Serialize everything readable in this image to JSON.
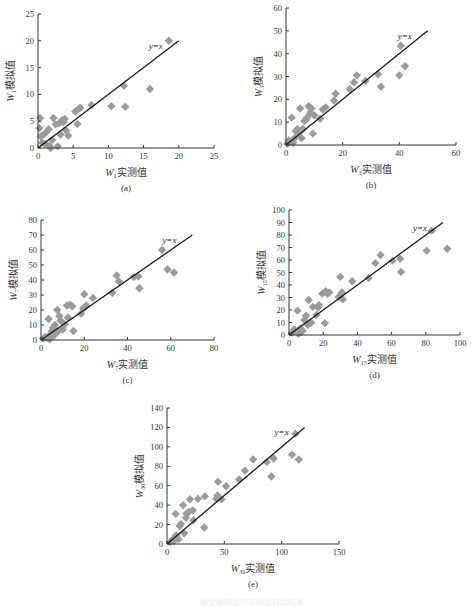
{
  "figure_caption": "模型模拟值与实测值对比结果",
  "chart_data": [
    {
      "id": "a",
      "type": "scatter",
      "panel_label": "(a)",
      "xlabel": "W1实测值",
      "xlabel_var": "W",
      "xlabel_sub": "1",
      "xlabel_text": "实测值",
      "ylabel": "W1模拟值",
      "ylabel_var": "W",
      "ylabel_sub": "1",
      "ylabel_text": "模拟值",
      "xlim": [
        0,
        25
      ],
      "ylim": [
        0,
        25
      ],
      "xticks": [
        0,
        5,
        10,
        15,
        20,
        25
      ],
      "yticks": [
        0,
        5,
        10,
        15,
        20,
        25
      ],
      "reference_line": {
        "label": "y=x",
        "from": [
          0,
          0
        ],
        "to": [
          20,
          20
        ]
      },
      "legend": "none",
      "grid": false,
      "points": [
        [
          0.2,
          3.7
        ],
        [
          0.3,
          5.6
        ],
        [
          0.4,
          2.2
        ],
        [
          0.6,
          1.0
        ],
        [
          0.8,
          2.5
        ],
        [
          1.0,
          0.8
        ],
        [
          1.2,
          3.0
        ],
        [
          1.5,
          3.5
        ],
        [
          1.6,
          0.4
        ],
        [
          1.8,
          0.0
        ],
        [
          2.0,
          1.5
        ],
        [
          2.2,
          5.6
        ],
        [
          2.5,
          4.4
        ],
        [
          2.8,
          0.3
        ],
        [
          3.0,
          4.6
        ],
        [
          3.2,
          2.5
        ],
        [
          3.4,
          5.2
        ],
        [
          3.6,
          4.8
        ],
        [
          3.8,
          5.4
        ],
        [
          4.0,
          3.2
        ],
        [
          4.3,
          2.3
        ],
        [
          5.3,
          6.8
        ],
        [
          5.6,
          4.5
        ],
        [
          5.8,
          7.3
        ],
        [
          6.0,
          7.5
        ],
        [
          7.6,
          8.0
        ],
        [
          10.4,
          7.8
        ],
        [
          12.2,
          11.6
        ],
        [
          12.4,
          7.7
        ],
        [
          15.9,
          11.0
        ],
        [
          18.6,
          20.0
        ]
      ]
    },
    {
      "id": "b",
      "type": "scatter",
      "panel_label": "(b)",
      "xlabel": "W3实测值",
      "xlabel_var": "W",
      "xlabel_sub": "3",
      "xlabel_text": "实测值",
      "ylabel": "W3模拟值",
      "ylabel_var": "W",
      "ylabel_sub": "3",
      "ylabel_text": "模拟值",
      "xlim": [
        0,
        60
      ],
      "ylim": [
        0,
        60
      ],
      "xticks": [
        0,
        20,
        40,
        60
      ],
      "yticks": [
        0,
        10,
        20,
        30,
        40,
        50,
        60
      ],
      "reference_line": {
        "label": "y=x",
        "from": [
          0,
          0
        ],
        "to": [
          50,
          50
        ]
      },
      "legend": "none",
      "grid": false,
      "points": [
        [
          0.5,
          0.5
        ],
        [
          1.0,
          2.0
        ],
        [
          2.0,
          12.0
        ],
        [
          2.5,
          1.0
        ],
        [
          3.0,
          3.0
        ],
        [
          3.5,
          6.0
        ],
        [
          4.0,
          7.0
        ],
        [
          4.5,
          5.0
        ],
        [
          5.0,
          16.0
        ],
        [
          5.5,
          3.0
        ],
        [
          6.0,
          7.0
        ],
        [
          6.5,
          10.5
        ],
        [
          7.0,
          11.0
        ],
        [
          7.5,
          12.0
        ],
        [
          8.0,
          17.0
        ],
        [
          8.5,
          14.0
        ],
        [
          9.0,
          16.0
        ],
        [
          9.5,
          5.0
        ],
        [
          10.0,
          13.0
        ],
        [
          12.0,
          11.5
        ],
        [
          13.0,
          15.5
        ],
        [
          14.0,
          16.5
        ],
        [
          17.0,
          19.5
        ],
        [
          17.5,
          22.5
        ],
        [
          22.5,
          24.5
        ],
        [
          24.0,
          27.5
        ],
        [
          25.0,
          30.5
        ],
        [
          28.0,
          28.0
        ],
        [
          32.5,
          31.0
        ],
        [
          33.5,
          25.5
        ],
        [
          40.0,
          30.5
        ],
        [
          40.5,
          43.5
        ],
        [
          42.0,
          34.5
        ]
      ]
    },
    {
      "id": "c",
      "type": "scatter",
      "panel_label": "(c)",
      "xlabel": "W7实测值",
      "xlabel_var": "W",
      "xlabel_sub": "7",
      "xlabel_text": "实测值",
      "ylabel": "W7模拟值",
      "ylabel_var": "W",
      "ylabel_sub": "7",
      "ylabel_text": "模拟值",
      "xlim": [
        0,
        80
      ],
      "ylim": [
        0,
        80
      ],
      "xticks": [
        0,
        20,
        40,
        60,
        80
      ],
      "yticks": [
        0,
        10,
        20,
        30,
        40,
        50,
        60,
        70,
        80
      ],
      "reference_line": {
        "label": "y=x",
        "from": [
          0,
          0
        ],
        "to": [
          70,
          70
        ]
      },
      "legend": "none",
      "grid": false,
      "points": [
        [
          1.0,
          1.0
        ],
        [
          2.0,
          2.0
        ],
        [
          3.0,
          1.5
        ],
        [
          3.5,
          14.0
        ],
        [
          4.0,
          0.5
        ],
        [
          4.5,
          4.0
        ],
        [
          5.0,
          6.0
        ],
        [
          5.5,
          8.0
        ],
        [
          6.0,
          3.0
        ],
        [
          6.5,
          10.0
        ],
        [
          7.0,
          5.0
        ],
        [
          7.5,
          20.0
        ],
        [
          8.0,
          6.0
        ],
        [
          8.5,
          16.0
        ],
        [
          9.0,
          13.0
        ],
        [
          10.0,
          7.0
        ],
        [
          11.0,
          10.5
        ],
        [
          12.0,
          23.0
        ],
        [
          12.5,
          15.0
        ],
        [
          13.5,
          23.5
        ],
        [
          14.5,
          22.5
        ],
        [
          15.0,
          6.0
        ],
        [
          18.5,
          17.5
        ],
        [
          19.5,
          21.0
        ],
        [
          20.0,
          30.5
        ],
        [
          21.0,
          23.0
        ],
        [
          24.0,
          28.0
        ],
        [
          33.0,
          31.5
        ],
        [
          35.0,
          43.0
        ],
        [
          36.0,
          39.0
        ],
        [
          43.0,
          42.0
        ],
        [
          45.0,
          42.5
        ],
        [
          45.5,
          34.5
        ],
        [
          56.0,
          60.0
        ],
        [
          58.5,
          47.0
        ],
        [
          61.5,
          45.0
        ]
      ]
    },
    {
      "id": "d",
      "type": "scatter",
      "panel_label": "(d)",
      "xlabel": "W15实测值",
      "xlabel_var": "W",
      "xlabel_sub": "15",
      "xlabel_text": "实测值",
      "ylabel": "W15模拟值",
      "ylabel_var": "W",
      "ylabel_sub": "15",
      "ylabel_text": "模拟值",
      "xlim": [
        0,
        100
      ],
      "ylim": [
        0,
        100
      ],
      "xticks": [
        0,
        20,
        40,
        60,
        80,
        100
      ],
      "yticks": [
        0,
        10,
        20,
        30,
        40,
        50,
        60,
        70,
        80,
        90,
        100
      ],
      "reference_line": {
        "label": "y=x",
        "from": [
          0,
          0
        ],
        "to": [
          90,
          90
        ]
      },
      "legend": "none",
      "grid": false,
      "points": [
        [
          2.0,
          2.0
        ],
        [
          3.0,
          4.5
        ],
        [
          5.0,
          19.5
        ],
        [
          5.5,
          1.0
        ],
        [
          6.5,
          5.0
        ],
        [
          7.0,
          2.0
        ],
        [
          8.0,
          3.5
        ],
        [
          9.0,
          12.0
        ],
        [
          10.0,
          15.5
        ],
        [
          11.0,
          8.0
        ],
        [
          11.5,
          28.0
        ],
        [
          13.0,
          10.0
        ],
        [
          14.0,
          22.5
        ],
        [
          16.0,
          16.0
        ],
        [
          17.0,
          22.0
        ],
        [
          17.5,
          24.0
        ],
        [
          19.5,
          33.0
        ],
        [
          21.0,
          9.5
        ],
        [
          21.5,
          35.0
        ],
        [
          22.5,
          33.0
        ],
        [
          23.5,
          34.0
        ],
        [
          29.0,
          30.5
        ],
        [
          30.0,
          46.5
        ],
        [
          31.0,
          34.0
        ],
        [
          31.5,
          28.5
        ],
        [
          37.0,
          43.0
        ],
        [
          46.5,
          45.5
        ],
        [
          50.5,
          57.5
        ],
        [
          53.5,
          64.0
        ],
        [
          60.5,
          59.5
        ],
        [
          65.0,
          61.0
        ],
        [
          65.5,
          50.5
        ],
        [
          80.5,
          67.5
        ],
        [
          83.5,
          83.5
        ],
        [
          92.5,
          69.0
        ]
      ]
    },
    {
      "id": "e",
      "type": "scatter",
      "panel_label": "(e)",
      "xlabel": "W30实测值",
      "xlabel_var": "W",
      "xlabel_sub": "30",
      "xlabel_text": "实测值",
      "ylabel": "W30模拟值",
      "ylabel_var": "W",
      "ylabel_sub": "30",
      "ylabel_text": "模拟值",
      "xlim": [
        0,
        150
      ],
      "ylim": [
        0,
        140
      ],
      "xticks": [
        0,
        50,
        100,
        150
      ],
      "yticks": [
        0,
        20,
        40,
        60,
        80,
        100,
        120,
        140
      ],
      "reference_line": {
        "label": "y=x",
        "from": [
          0,
          0
        ],
        "to": [
          120,
          120
        ]
      },
      "legend": "none",
      "grid": false,
      "points": [
        [
          3.0,
          2.0
        ],
        [
          5.0,
          5.0
        ],
        [
          6.0,
          3.0
        ],
        [
          7.5,
          31.0
        ],
        [
          8.0,
          9.0
        ],
        [
          10.0,
          5.0
        ],
        [
          11.0,
          18.5
        ],
        [
          12.0,
          20.5
        ],
        [
          14.0,
          40.0
        ],
        [
          15.0,
          11.0
        ],
        [
          16.5,
          27.0
        ],
        [
          17.0,
          31.5
        ],
        [
          19.0,
          33.0
        ],
        [
          20.0,
          46.0
        ],
        [
          22.5,
          34.5
        ],
        [
          23.0,
          24.5
        ],
        [
          27.0,
          46.5
        ],
        [
          32.5,
          17.0
        ],
        [
          33.0,
          49.0
        ],
        [
          43.0,
          46.5
        ],
        [
          44.0,
          50.0
        ],
        [
          44.5,
          64.0
        ],
        [
          47.5,
          46.0
        ],
        [
          51.5,
          59.5
        ],
        [
          63.0,
          66.5
        ],
        [
          68.0,
          75.5
        ],
        [
          75.0,
          87.0
        ],
        [
          87.0,
          84.5
        ],
        [
          91.0,
          69.5
        ],
        [
          93.0,
          88.0
        ],
        [
          109.0,
          92.0
        ],
        [
          112.0,
          113.5
        ],
        [
          115.0,
          87.0
        ]
      ]
    }
  ],
  "colors": {
    "marker": "#9b9b9b",
    "line": "#1a1a1a",
    "axis": "#333333",
    "text": "#333333"
  }
}
